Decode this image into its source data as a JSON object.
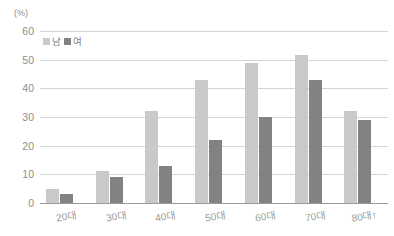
{
  "chart_data": {
    "type": "bar",
    "title": "",
    "xlabel": "",
    "ylabel": "(%)",
    "ylim": [
      0,
      60
    ],
    "yticks": [
      0,
      10,
      20,
      30,
      40,
      50,
      60
    ],
    "grid": true,
    "legend_position": "top-left",
    "categories": [
      "20대",
      "30대",
      "40대",
      "50대",
      "60대",
      "70대",
      "80대↑"
    ],
    "series": [
      {
        "name": "남",
        "color": "#c9c9c9",
        "values": [
          5,
          11,
          32,
          43,
          49,
          51.5,
          32
        ]
      },
      {
        "name": "여",
        "color": "#828282",
        "values": [
          3,
          9,
          13,
          22,
          30,
          43,
          29
        ]
      }
    ]
  },
  "axis": {
    "unit_label": "(%)",
    "tick_labels": [
      "60",
      "50",
      "40",
      "30",
      "20",
      "10",
      "0"
    ]
  },
  "colors": {
    "male_bar": "#c9c9c9",
    "female_bar": "#828282",
    "gridline": "#d4d4d4",
    "baseline": "#9a9a9a",
    "text": "#8d8d8d",
    "background": "#ffffff"
  }
}
